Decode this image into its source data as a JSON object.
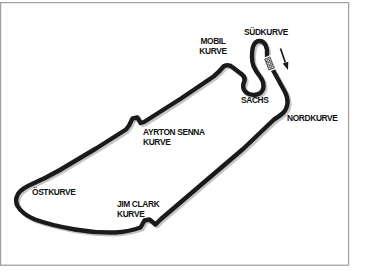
{
  "figure": {
    "name": "race-circuit-map",
    "corner_labels": {
      "sudkurve": {
        "text": "SÜDKURVE"
      },
      "mobil": {
        "line1": "MOBIL",
        "line2": "KURVE"
      },
      "sachs": {
        "text": "SACHS"
      },
      "nordkurve": {
        "text": "NORDKURVE"
      },
      "ayrton_senna": {
        "line1": "AYRTON SENNA",
        "line2": "KURVE"
      },
      "ostkurve": {
        "text": "ÖSTKURVE"
      },
      "jim_clark": {
        "line1": "JIM CLARK",
        "line2": "KURVE"
      }
    },
    "markers": {
      "start_finish": "checkered start/finish line",
      "direction_arrow": "race direction arrow pointing down-right along start/finish straight"
    },
    "colors": {
      "track": "#1a1a1a",
      "track_shadow": "#c5c5c5",
      "frame": "#9e9e9e",
      "background": "#ffffff",
      "text": "#111111"
    }
  }
}
